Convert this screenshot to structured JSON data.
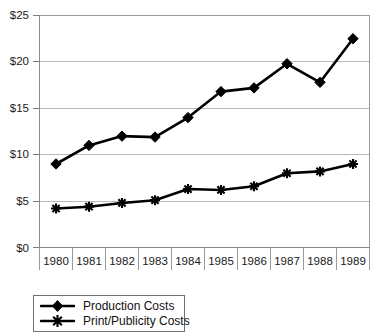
{
  "chart_data": {
    "type": "line",
    "title": "",
    "xlabel": "",
    "ylabel": "",
    "categories": [
      "1980",
      "1981",
      "1982",
      "1983",
      "1984",
      "1985",
      "1986",
      "1987",
      "1988",
      "1989"
    ],
    "x": [
      1980,
      1981,
      1982,
      1983,
      1984,
      1985,
      1986,
      1987,
      1988,
      1989
    ],
    "series": [
      {
        "name": "Production Costs",
        "marker": "diamond",
        "values": [
          9.0,
          11.0,
          12.0,
          11.9,
          14.0,
          16.8,
          17.2,
          19.8,
          17.8,
          22.5
        ]
      },
      {
        "name": "Print/Publicity Costs",
        "marker": "star",
        "values": [
          4.2,
          4.4,
          4.8,
          5.1,
          6.3,
          6.2,
          6.6,
          8.0,
          8.2,
          9.0
        ]
      }
    ],
    "ylim": [
      0,
      25
    ],
    "yticks": [
      0,
      5,
      10,
      15,
      20,
      25
    ],
    "ytick_labels": [
      "$0",
      "$5",
      "$10",
      "$15",
      "$20",
      "$25"
    ],
    "grid": true,
    "legend_position": "bottom-left",
    "colors": {
      "series_line": "#000000",
      "grid": "#b9b9b9",
      "axis": "#8a8a8a",
      "background": "#ffffff"
    }
  },
  "axes": {
    "y_labels": [
      "$25",
      "$20",
      "$15",
      "$10",
      "$5",
      "$0"
    ],
    "x_labels": [
      "1980",
      "1981",
      "1982",
      "1983",
      "1984",
      "1985",
      "1986",
      "1987",
      "1988",
      "1989"
    ]
  },
  "legend": {
    "items": [
      {
        "label": "Production Costs",
        "marker": "diamond"
      },
      {
        "label": "Print/Publicity Costs",
        "marker": "star"
      }
    ]
  }
}
